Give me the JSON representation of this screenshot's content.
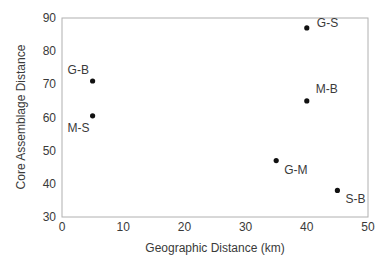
{
  "chart_data": {
    "type": "scatter",
    "title": "",
    "xlabel": "Geographic Distance (km)",
    "ylabel": "Core Assemblage Distance",
    "xlim": [
      0,
      50
    ],
    "ylim": [
      30,
      90
    ],
    "xticks": [
      0,
      10,
      20,
      30,
      40,
      50
    ],
    "yticks": [
      30,
      40,
      50,
      60,
      70,
      80,
      90
    ],
    "grid": false,
    "legend": null,
    "points": [
      {
        "label": "G-B",
        "x": 5,
        "y": 71,
        "label_pos": "upper-left"
      },
      {
        "label": "M-S",
        "x": 5,
        "y": 60.5,
        "label_pos": "lower-left"
      },
      {
        "label": "G-S",
        "x": 40,
        "y": 87,
        "label_pos": "right"
      },
      {
        "label": "M-B",
        "x": 40,
        "y": 65,
        "label_pos": "upper-right"
      },
      {
        "label": "G-M",
        "x": 35,
        "y": 47,
        "label_pos": "lower-right"
      },
      {
        "label": "S-B",
        "x": 45,
        "y": 38,
        "label_pos": "lower-right"
      }
    ]
  },
  "colors": {
    "axis": "#b0b0b0",
    "point": "#111111",
    "text": "#3a3a3a"
  }
}
